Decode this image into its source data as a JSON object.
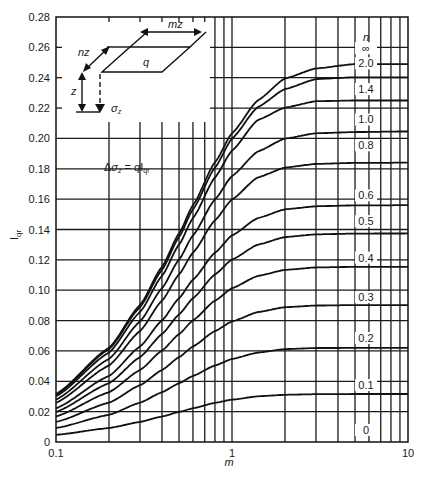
{
  "chart_data": {
    "type": "line",
    "title": "",
    "xlabel": "m",
    "ylabel": "I_qr",
    "xscale": "log",
    "xlim": [
      0.1,
      10
    ],
    "ylim": [
      0,
      0.28
    ],
    "grid": true,
    "x_tick_labels": [
      "0.1",
      "1",
      "10"
    ],
    "y_tick_labels": [
      "0",
      "0.02",
      "0.04",
      "0.06",
      "0.08",
      "0.10",
      "0.12",
      "0.14",
      "0.16",
      "0.18",
      "0.20",
      "0.22",
      "0.24",
      "0.26",
      "0.28"
    ],
    "legend_title": "n",
    "equation": "Δσz = q Iqr",
    "x": [
      0.1,
      0.2,
      0.3,
      0.4,
      0.5,
      0.6,
      0.8,
      1.0,
      1.4,
      2.0,
      3.0,
      5.0,
      10.0
    ],
    "series": [
      {
        "name": "∞",
        "values": [
          0.0316,
          0.062,
          0.0902,
          0.1154,
          0.1374,
          0.156,
          0.1843,
          0.2034,
          0.225,
          0.2395,
          0.2461,
          0.249,
          0.249
        ]
      },
      {
        "name": "2.0",
        "values": [
          0.0311,
          0.0612,
          0.0888,
          0.1134,
          0.135,
          0.1533,
          0.1808,
          0.1999,
          0.2206,
          0.2325,
          0.2391,
          0.2403,
          0.2403
        ]
      },
      {
        "name": "1.4",
        "values": [
          0.0301,
          0.0589,
          0.0856,
          0.1094,
          0.13,
          0.1475,
          0.1743,
          0.192,
          0.2121,
          0.2203,
          0.2245,
          0.225,
          0.225
        ]
      },
      {
        "name": "1.0",
        "values": [
          0.0279,
          0.0547,
          0.0794,
          0.1013,
          0.1202,
          0.1361,
          0.1598,
          0.1752,
          0.1914,
          0.1999,
          0.2034,
          0.2042,
          0.2046
        ]
      },
      {
        "name": "0.8",
        "values": [
          0.0258,
          0.0504,
          0.0731,
          0.0931,
          0.1104,
          0.1247,
          0.1461,
          0.1598,
          0.1743,
          0.1808,
          0.1832,
          0.1839,
          0.184
        ]
      },
      {
        "name": "0.6",
        "values": [
          0.0222,
          0.0435,
          0.0629,
          0.0801,
          0.0947,
          0.1069,
          0.1247,
          0.1361,
          0.1475,
          0.1533,
          0.1553,
          0.1559,
          0.156
        ]
      },
      {
        "name": "0.5",
        "values": [
          0.0198,
          0.0387,
          0.0559,
          0.0711,
          0.084,
          0.0947,
          0.1104,
          0.1202,
          0.13,
          0.135,
          0.1368,
          0.1373,
          0.1374
        ]
      },
      {
        "name": "0.4",
        "values": [
          0.0168,
          0.0328,
          0.0474,
          0.0602,
          0.0711,
          0.0801,
          0.0931,
          0.1013,
          0.1094,
          0.1134,
          0.115,
          0.1154,
          0.1154
        ]
      },
      {
        "name": "0.3",
        "values": [
          0.0132,
          0.0259,
          0.0374,
          0.0474,
          0.0559,
          0.0629,
          0.0731,
          0.0794,
          0.0856,
          0.0888,
          0.0899,
          0.0902,
          0.0902
        ]
      },
      {
        "name": "0.2",
        "values": [
          0.0092,
          0.0179,
          0.0259,
          0.0328,
          0.0387,
          0.0435,
          0.0504,
          0.0547,
          0.0589,
          0.0612,
          0.0619,
          0.062,
          0.062
        ]
      },
      {
        "name": "0.1",
        "values": [
          0.0047,
          0.0092,
          0.0132,
          0.0168,
          0.0198,
          0.0222,
          0.0258,
          0.0279,
          0.0301,
          0.0311,
          0.0315,
          0.0316,
          0.0316
        ]
      },
      {
        "name": "0",
        "values": [
          0,
          0,
          0,
          0,
          0,
          0,
          0,
          0,
          0,
          0,
          0,
          0,
          0
        ]
      }
    ],
    "inset": {
      "labels": [
        "mz",
        "nz",
        "q",
        "z",
        "σz"
      ]
    }
  }
}
